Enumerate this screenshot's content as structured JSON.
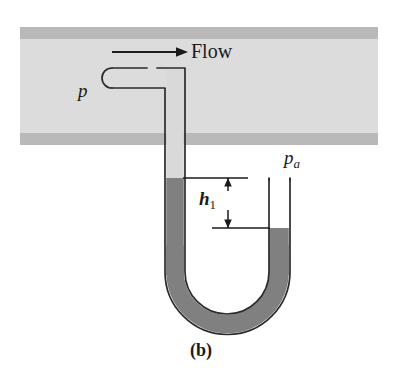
{
  "figure": {
    "caption": "(b)",
    "labels": {
      "flow": "Flow",
      "pressure_probe": "p",
      "ambient_pressure_base": "p",
      "ambient_pressure_sub": "a",
      "height_base": "h",
      "height_sub": "1"
    },
    "icons": {
      "flow_arrow": "arrow-right-icon",
      "dimension_arrow_up": "arrow-up-icon",
      "dimension_arrow_down": "arrow-down-icon"
    },
    "colors": {
      "pipe_interior": "#dcdcdc",
      "pipe_wall": "#b9b9b9",
      "manometer_fluid": "#808080",
      "manometer_light_fluid": "#d9d9d9",
      "outline": "#2b2b2b",
      "background": "#ffffff"
    },
    "geometry": {
      "pipe_left": 20,
      "pipe_right": 378,
      "pipe_top": 27,
      "pipe_bottom": 145,
      "pipe_wall_thickness": 12,
      "left_tube_x": 165,
      "left_tube_width": 20,
      "left_mercury_level_y": 178,
      "right_tube_x": 268,
      "right_tube_width": 22,
      "right_tube_top_y": 178,
      "right_mercury_level_y": 228,
      "u_bend_bottom_y": 325,
      "dimension_line_x": 228
    }
  }
}
